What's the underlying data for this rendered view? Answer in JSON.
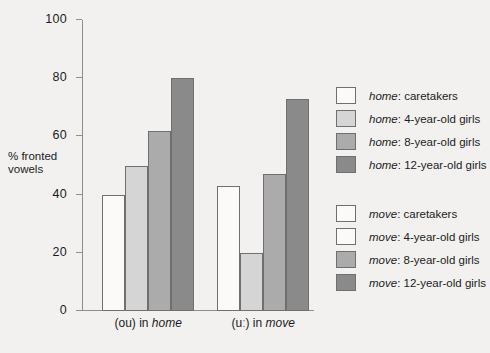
{
  "chart_data": {
    "type": "bar",
    "title": "",
    "xlabel": "",
    "ylabel": "% fronted vowels",
    "ylim": [
      0,
      100
    ],
    "ytick_values": [
      0,
      20,
      40,
      60,
      80,
      100
    ],
    "ytick_labels": [
      "0",
      "20",
      "40",
      "60",
      "80",
      "100"
    ],
    "grid": false,
    "legend_position": "right",
    "categories": [
      "(ou) in home",
      "(uː) in move"
    ],
    "category_labels": [
      {
        "prefix": "(ou) in ",
        "word": "home"
      },
      {
        "prefix": "(uː) in ",
        "word": "move"
      }
    ],
    "series": [
      {
        "name": "caretakers",
        "values": [
          40,
          43
        ],
        "color": "#fbfaf8"
      },
      {
        "name": "4-year-old girls",
        "values": [
          50,
          20
        ],
        "color": "#d5d5d5"
      },
      {
        "name": "8-year-old girls",
        "values": [
          62,
          47
        ],
        "color": "#ababab"
      },
      {
        "name": "12-year-old girls",
        "values": [
          80,
          73
        ],
        "color": "#8a8a8a"
      }
    ]
  },
  "legend": {
    "groups": [
      {
        "keyword": "home",
        "items": [
          {
            "keyword": "home",
            "label": ": caretakers",
            "color": "#fbfaf8"
          },
          {
            "keyword": "home",
            "label": ": 4-year-old girls",
            "color": "#d5d5d5"
          },
          {
            "keyword": "home",
            "label": ": 8-year-old girls",
            "color": "#ababab"
          },
          {
            "keyword": "home",
            "label": ": 12-year-old girls",
            "color": "#8a8a8a"
          }
        ]
      },
      {
        "keyword": "move",
        "items": [
          {
            "keyword": "move",
            "label": ": caretakers",
            "color": "#fbfaf8"
          },
          {
            "keyword": "move",
            "label": ": 4-year-old girls",
            "color": "#fbfaf8"
          },
          {
            "keyword": "move",
            "label": ": 8-year-old girls",
            "color": "#ababab"
          },
          {
            "keyword": "move",
            "label": ": 12-year-old girls",
            "color": "#8a8a8a"
          }
        ]
      }
    ]
  }
}
